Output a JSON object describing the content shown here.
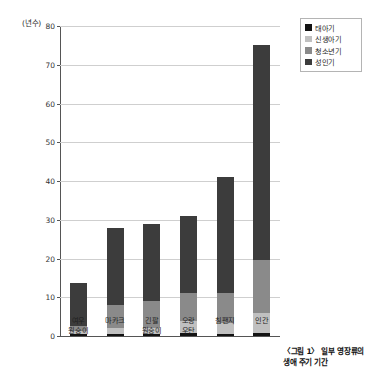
{
  "chart_data": {
    "type": "bar",
    "subtype": "stacked-bar",
    "title": "",
    "xlabel": "",
    "ylabel": "(년수)",
    "ylim": [
      0,
      80
    ],
    "yticks": [
      0,
      10,
      20,
      30,
      40,
      50,
      60,
      70,
      80
    ],
    "ytick_labels": [
      "0",
      "10",
      "20",
      "30",
      "40",
      "50",
      "60",
      "70",
      "80"
    ],
    "grid": true,
    "legend_position": "top-right",
    "categories": [
      "여우\n원숭이",
      "마카크",
      "긴팔\n원숭이",
      "오랑\n우탄",
      "침팬지",
      "인간"
    ],
    "category_labels": [
      [
        "여우",
        "원숭이"
      ],
      [
        "마카크"
      ],
      [
        "긴팔",
        "원숭이"
      ],
      [
        "오랑",
        "우탄"
      ],
      [
        "침팬지"
      ],
      [
        "인간"
      ]
    ],
    "series": [
      {
        "name": "태아기",
        "color": "#131313",
        "values": [
          0.4,
          0.45,
          0.6,
          0.7,
          0.6,
          0.75
        ]
      },
      {
        "name": "신생아기",
        "color": "#c0c0c0",
        "values": [
          1.0,
          1.6,
          1.5,
          3.1,
          2.8,
          5.25
        ]
      },
      {
        "name": "청소년기",
        "color": "#8a8a8a",
        "values": [
          1.3,
          5.9,
          6.9,
          7.2,
          7.6,
          13.5
        ]
      },
      {
        "name": "성인기",
        "color": "#3c3c3c",
        "values": [
          11.0,
          20.0,
          20.0,
          20.0,
          30.0,
          55.5
        ]
      }
    ],
    "totals": [
      13.7,
      28.0,
      29.0,
      31.0,
      41.0,
      75.0
    ]
  },
  "legend": {
    "items": [
      {
        "label": "태아기",
        "color": "#131313"
      },
      {
        "label": "신생아기",
        "color": "#c0c0c0"
      },
      {
        "label": "청소년기",
        "color": "#8a8a8a"
      },
      {
        "label": "성인기",
        "color": "#3c3c3c"
      }
    ]
  },
  "caption": {
    "line1": "〈그림 1〉 일부 영장류의",
    "line2": "생애 주기 기간"
  }
}
